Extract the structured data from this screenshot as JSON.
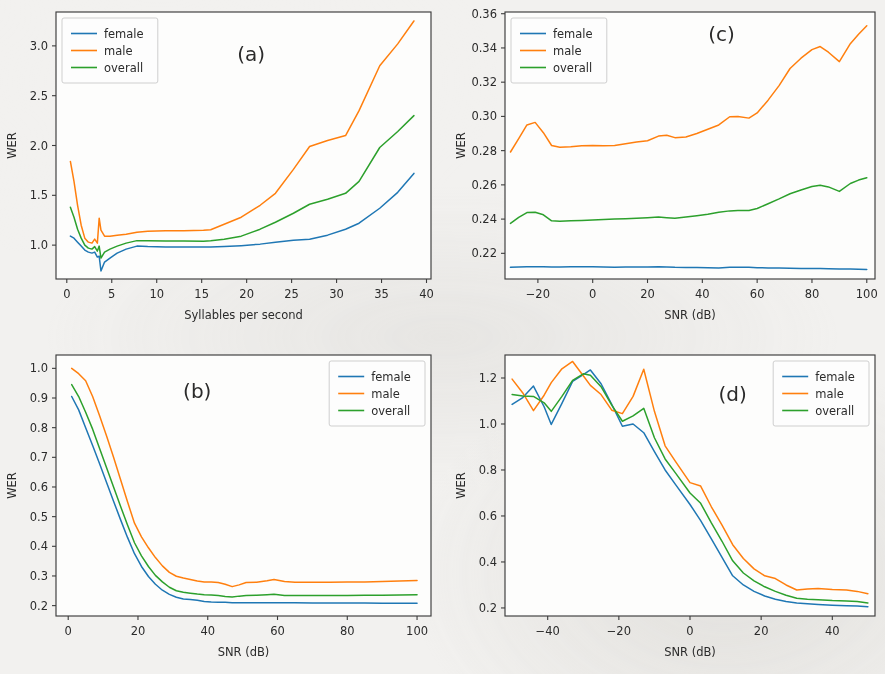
{
  "figure": {
    "background_color": "#f2f1ef",
    "axes_background_color": "#fdfdfc",
    "panel_count": 4
  },
  "series_colors": {
    "female": "#1f77b4",
    "male": "#ff7f0e",
    "overall": "#2ca02c"
  },
  "legend_labels": {
    "female": "female",
    "male": "male",
    "overall": "overall"
  },
  "chart_data": [
    {
      "id": "panel-a",
      "type": "line",
      "title": "(a)",
      "panel_label": "(a)",
      "xlabel": "Syllables per second",
      "ylabel": "WER",
      "xlim": [
        -1.2,
        40.5
      ],
      "ylim": [
        0.66,
        3.34
      ],
      "xticks": [
        0,
        5,
        10,
        15,
        20,
        25,
        30,
        35,
        40
      ],
      "xtick_labels": [
        "0",
        "5",
        "10",
        "15",
        "20",
        "25",
        "30",
        "35",
        "40"
      ],
      "yticks": [
        1.0,
        1.5,
        2.0,
        2.5,
        3.0
      ],
      "ytick_labels": [
        "1.0",
        "1.5",
        "2.0",
        "2.5",
        "3.0"
      ],
      "grid": false,
      "legend_position": "upper left",
      "legend_entries": [
        "female",
        "male",
        "overall"
      ],
      "panel_label_position": [
        20.5,
        2.85
      ],
      "x": [
        0.4,
        0.8,
        1.2,
        1.6,
        2.0,
        2.4,
        2.8,
        3.1,
        3.4,
        3.6,
        3.8,
        4.2,
        4.8,
        5.6,
        6.6,
        7.8,
        9.0,
        11.0,
        13.0,
        15.2,
        16.0,
        17.5,
        19.4,
        21.5,
        23.2,
        25.2,
        27.0,
        29.0,
        31.0,
        32.5,
        34.8,
        36.8,
        38.6
      ],
      "series": [
        {
          "name": "female",
          "values": [
            1.09,
            1.07,
            1.03,
            0.99,
            0.95,
            0.93,
            0.92,
            0.93,
            0.88,
            0.89,
            0.74,
            0.83,
            0.87,
            0.92,
            0.96,
            0.99,
            0.985,
            0.982,
            0.981,
            0.98,
            0.98,
            0.985,
            0.995,
            1.01,
            1.03,
            1.05,
            1.06,
            1.1,
            1.16,
            1.22,
            1.37,
            1.53,
            1.72
          ]
        },
        {
          "name": "male",
          "values": [
            1.84,
            1.64,
            1.4,
            1.2,
            1.07,
            1.03,
            1.02,
            1.06,
            1.02,
            1.27,
            1.15,
            1.09,
            1.09,
            1.1,
            1.11,
            1.13,
            1.14,
            1.145,
            1.145,
            1.15,
            1.155,
            1.21,
            1.28,
            1.4,
            1.52,
            1.76,
            1.99,
            2.05,
            2.1,
            2.35,
            2.8,
            3.02,
            3.25
          ]
        },
        {
          "name": "overall",
          "values": [
            1.38,
            1.28,
            1.16,
            1.07,
            1.0,
            0.97,
            0.96,
            0.985,
            0.94,
            0.99,
            0.87,
            0.93,
            0.96,
            0.99,
            1.02,
            1.045,
            1.045,
            1.042,
            1.041,
            1.04,
            1.045,
            1.06,
            1.09,
            1.16,
            1.23,
            1.32,
            1.41,
            1.46,
            1.52,
            1.64,
            1.98,
            2.14,
            2.3
          ]
        }
      ]
    },
    {
      "id": "panel-c",
      "type": "line",
      "title": "(c)",
      "panel_label": "(c)",
      "xlabel": "SNR (dB)",
      "ylabel": "WER",
      "xlim": [
        -32,
        103
      ],
      "ylim": [
        0.205,
        0.361
      ],
      "xticks": [
        -20,
        0,
        20,
        40,
        60,
        80,
        100
      ],
      "xtick_labels": [
        "−20",
        "0",
        "20",
        "40",
        "60",
        "80",
        "100"
      ],
      "yticks": [
        0.22,
        0.24,
        0.26,
        0.28,
        0.3,
        0.32,
        0.34,
        0.36
      ],
      "ytick_labels": [
        "0.22",
        "0.24",
        "0.26",
        "0.28",
        "0.30",
        "0.32",
        "0.34",
        "0.36"
      ],
      "grid": false,
      "legend_position": "upper left",
      "legend_entries": [
        "female",
        "male",
        "overall"
      ],
      "panel_label_position": [
        47,
        0.344
      ],
      "x": [
        -30,
        -27,
        -24,
        -21,
        -18,
        -15,
        -12,
        -8,
        -4,
        0,
        4,
        8,
        12,
        16,
        20,
        24,
        27,
        30,
        34,
        38,
        42,
        46,
        50,
        53,
        57,
        60,
        64,
        68,
        72,
        76,
        80,
        83,
        86,
        90,
        94,
        97,
        100
      ],
      "series": [
        {
          "name": "female",
          "values": [
            0.2118,
            0.212,
            0.2121,
            0.2122,
            0.2122,
            0.212,
            0.212,
            0.2122,
            0.2122,
            0.2122,
            0.212,
            0.2119,
            0.212,
            0.212,
            0.212,
            0.2121,
            0.212,
            0.2118,
            0.2117,
            0.2117,
            0.2116,
            0.2115,
            0.2118,
            0.2119,
            0.2118,
            0.2116,
            0.2115,
            0.2114,
            0.2113,
            0.2112,
            0.2112,
            0.2111,
            0.211,
            0.2109,
            0.2108,
            0.2107,
            0.2106
          ]
        },
        {
          "name": "male",
          "values": [
            0.2792,
            0.287,
            0.295,
            0.2965,
            0.2905,
            0.283,
            0.282,
            0.2822,
            0.2828,
            0.283,
            0.2828,
            0.283,
            0.284,
            0.285,
            0.2858,
            0.2885,
            0.289,
            0.2876,
            0.288,
            0.29,
            0.2925,
            0.295,
            0.2998,
            0.3,
            0.299,
            0.302,
            0.3095,
            0.318,
            0.328,
            0.334,
            0.339,
            0.3408,
            0.3375,
            0.332,
            0.3425,
            0.348,
            0.353
          ]
        },
        {
          "name": "overall",
          "values": [
            0.2375,
            0.241,
            0.2438,
            0.244,
            0.2425,
            0.239,
            0.2388,
            0.239,
            0.2392,
            0.2395,
            0.2398,
            0.24,
            0.2402,
            0.2405,
            0.2408,
            0.2412,
            0.2408,
            0.2405,
            0.2412,
            0.242,
            0.2428,
            0.244,
            0.2448,
            0.245,
            0.245,
            0.2462,
            0.249,
            0.2518,
            0.2548,
            0.257,
            0.259,
            0.2598,
            0.2588,
            0.2562,
            0.2608,
            0.2628,
            0.2642
          ]
        }
      ]
    },
    {
      "id": "panel-b",
      "type": "line",
      "title": "(b)",
      "panel_label": "(b)",
      "xlabel": "SNR (dB)",
      "ylabel": "WER",
      "xlim": [
        -3.5,
        104
      ],
      "ylim": [
        0.165,
        1.045
      ],
      "xticks": [
        0,
        20,
        40,
        60,
        80,
        100
      ],
      "xtick_labels": [
        "0",
        "20",
        "40",
        "60",
        "80",
        "100"
      ],
      "yticks": [
        0.2,
        0.3,
        0.4,
        0.5,
        0.6,
        0.7,
        0.8,
        0.9,
        1.0
      ],
      "ytick_labels": [
        "0.2",
        "0.3",
        "0.4",
        "0.5",
        "0.6",
        "0.7",
        "0.8",
        "0.9",
        "1.0"
      ],
      "grid": false,
      "legend_position": "upper right",
      "legend_entries": [
        "female",
        "male",
        "overall"
      ],
      "panel_label_position": [
        37,
        0.9
      ],
      "x": [
        1,
        3,
        5,
        7,
        9,
        11,
        13,
        15,
        17,
        19,
        21,
        23,
        25,
        27,
        29,
        31,
        33,
        35,
        37,
        39,
        41,
        43,
        45,
        47,
        49,
        51,
        54,
        57,
        59,
        62,
        65,
        70,
        75,
        80,
        85,
        90,
        95,
        100
      ],
      "series": [
        {
          "name": "female",
          "values": [
            0.905,
            0.86,
            0.8,
            0.74,
            0.678,
            0.615,
            0.552,
            0.49,
            0.43,
            0.375,
            0.332,
            0.298,
            0.272,
            0.252,
            0.238,
            0.228,
            0.222,
            0.221,
            0.218,
            0.214,
            0.212,
            0.211,
            0.211,
            0.21,
            0.21,
            0.21,
            0.21,
            0.21,
            0.21,
            0.21,
            0.21,
            0.209,
            0.209,
            0.209,
            0.209,
            0.208,
            0.208,
            0.208
          ]
        },
        {
          "name": "male",
          "values": [
            1.0,
            0.982,
            0.958,
            0.905,
            0.84,
            0.772,
            0.7,
            0.625,
            0.55,
            0.478,
            0.432,
            0.395,
            0.362,
            0.334,
            0.312,
            0.299,
            0.293,
            0.288,
            0.283,
            0.28,
            0.28,
            0.278,
            0.272,
            0.264,
            0.27,
            0.278,
            0.279,
            0.284,
            0.288,
            0.281,
            0.279,
            0.279,
            0.279,
            0.28,
            0.28,
            0.281,
            0.283,
            0.285
          ]
        },
        {
          "name": "overall",
          "values": [
            0.945,
            0.905,
            0.852,
            0.795,
            0.73,
            0.665,
            0.6,
            0.535,
            0.472,
            0.412,
            0.368,
            0.332,
            0.302,
            0.28,
            0.262,
            0.25,
            0.245,
            0.242,
            0.239,
            0.237,
            0.236,
            0.234,
            0.231,
            0.229,
            0.232,
            0.234,
            0.235,
            0.237,
            0.238,
            0.234,
            0.234,
            0.234,
            0.234,
            0.234,
            0.235,
            0.235,
            0.236,
            0.237
          ]
        }
      ]
    },
    {
      "id": "panel-d",
      "type": "line",
      "title": "(d)",
      "panel_label": "(d)",
      "xlabel": "SNR (dB)",
      "ylabel": "WER",
      "xlim": [
        -52,
        52
      ],
      "ylim": [
        0.165,
        1.3
      ],
      "xticks": [
        -40,
        -20,
        0,
        20,
        40
      ],
      "xtick_labels": [
        "−40",
        "−20",
        "0",
        "20",
        "40"
      ],
      "yticks": [
        0.2,
        0.4,
        0.6,
        0.8,
        1.0,
        1.2
      ],
      "ytick_labels": [
        "0.2",
        "0.4",
        "0.6",
        "0.8",
        "1.0",
        "1.2"
      ],
      "grid": false,
      "legend_position": "upper right",
      "legend_entries": [
        "female",
        "male",
        "overall"
      ],
      "panel_label_position": [
        12,
        1.1
      ],
      "x": [
        -50,
        -47,
        -44,
        -41,
        -39,
        -36,
        -33,
        -30,
        -28,
        -25,
        -22,
        -19,
        -16,
        -13,
        -10,
        -7,
        -4,
        0,
        3,
        6,
        9,
        12,
        15,
        18,
        21,
        24,
        27,
        30,
        33,
        36,
        40,
        44,
        47,
        50
      ],
      "series": [
        {
          "name": "female",
          "values": [
            1.085,
            1.115,
            1.165,
            1.075,
            0.998,
            1.09,
            1.185,
            1.215,
            1.235,
            1.175,
            1.085,
            0.99,
            1.0,
            0.962,
            0.88,
            0.8,
            0.735,
            0.65,
            0.58,
            0.5,
            0.42,
            0.34,
            0.3,
            0.272,
            0.252,
            0.238,
            0.228,
            0.222,
            0.218,
            0.215,
            0.212,
            0.21,
            0.208,
            0.205
          ]
        },
        {
          "name": "male",
          "values": [
            1.195,
            1.135,
            1.058,
            1.125,
            1.18,
            1.24,
            1.272,
            1.21,
            1.168,
            1.128,
            1.06,
            1.045,
            1.12,
            1.238,
            1.055,
            0.905,
            0.835,
            0.745,
            0.73,
            0.64,
            0.56,
            0.475,
            0.415,
            0.37,
            0.34,
            0.328,
            0.3,
            0.278,
            0.282,
            0.285,
            0.28,
            0.278,
            0.272,
            0.262
          ]
        },
        {
          "name": "overall",
          "values": [
            1.128,
            1.122,
            1.12,
            1.092,
            1.055,
            1.12,
            1.19,
            1.218,
            1.212,
            1.162,
            1.082,
            1.012,
            1.035,
            1.068,
            0.94,
            0.848,
            0.785,
            0.7,
            0.655,
            0.57,
            0.49,
            0.405,
            0.352,
            0.318,
            0.292,
            0.272,
            0.255,
            0.242,
            0.238,
            0.236,
            0.232,
            0.23,
            0.228,
            0.222
          ]
        }
      ]
    }
  ]
}
